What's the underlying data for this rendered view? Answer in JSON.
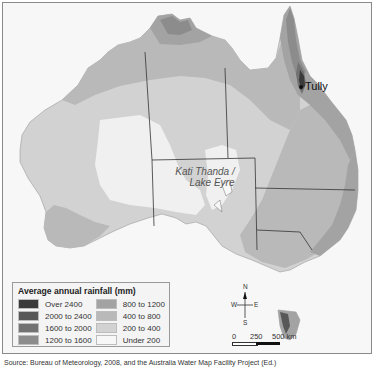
{
  "map": {
    "title": "Average annual rainfall in Australia",
    "labels": {
      "lake": "Kati Thanda / Lake Eyre",
      "lake_line1": "Kati Thanda /",
      "lake_line2": "Lake Eyre",
      "city": "Tully"
    },
    "colors": {
      "background": "#f7f7f7",
      "over_2400": "#3a3a3a",
      "2000_2400": "#585858",
      "1600_2000": "#727272",
      "1200_1600": "#8c8c8c",
      "800_1200": "#a3a3a3",
      "400_800": "#b9b9b9",
      "200_400": "#d2d2d2",
      "under_200": "#f0f0f0",
      "borders": "#333333",
      "rivers": "#6f6f6f"
    }
  },
  "legend": {
    "title": "Average annual rainfall (mm)",
    "items": [
      {
        "label": "Over 2400",
        "color": "#3a3a3a"
      },
      {
        "label": "800 to 1200",
        "color": "#a3a3a3"
      },
      {
        "label": "2000 to 2400",
        "color": "#585858"
      },
      {
        "label": "400 to 800",
        "color": "#b9b9b9"
      },
      {
        "label": "1600 to 2000",
        "color": "#727272"
      },
      {
        "label": "200 to 400",
        "color": "#d2d2d2"
      },
      {
        "label": "1200 to 1600",
        "color": "#8c8c8c"
      },
      {
        "label": "Under 200",
        "color": "#f0f0f0"
      }
    ]
  },
  "compass": {
    "n": "N",
    "s": "S",
    "e": "E",
    "w": "W"
  },
  "scale": {
    "ticks": [
      "0",
      "250",
      "500 km"
    ]
  },
  "source": {
    "text": "Source: Bureau of Meteorology, 2008, and the Australia Water Map Facility Project (Ed.)"
  }
}
